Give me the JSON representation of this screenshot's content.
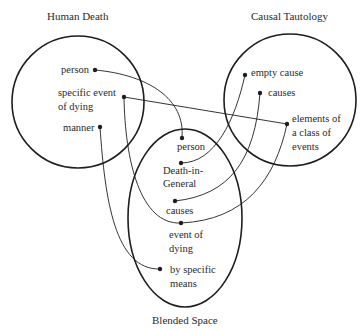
{
  "spaces": {
    "human_death": {
      "title": "Human Death",
      "elements": {
        "person": "person",
        "specific_event_line1": "specific event",
        "specific_event_line2": "of dying",
        "manner": "manner"
      }
    },
    "causal_tautology": {
      "title": "Causal Tautology",
      "elements": {
        "empty_cause": "empty cause",
        "causes": "causes",
        "elements_line1": "elements of",
        "elements_line2": "a class of",
        "elements_line3": "events"
      }
    },
    "blended_space": {
      "title": "Blended Space",
      "elements": {
        "person": "person",
        "death_line1": "Death-in-",
        "death_line2": "General",
        "causes": "causes",
        "event_line1": "event of",
        "event_line2": "dying",
        "means_line1": "by specific",
        "means_line2": "means"
      }
    }
  },
  "colors": {
    "stroke": "#1e1e1e",
    "text": "#2a2a2a",
    "background": "#ffffff"
  }
}
